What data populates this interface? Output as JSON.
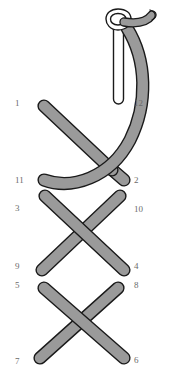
{
  "figure": {
    "background_color": "#ffffff",
    "strand_fill": "#9a9a9a",
    "strand_stroke": "#1a1a1a",
    "needle_fill": "#ffffff",
    "needle_stroke": "#1a1a1a",
    "label_color": "#6b6b6b",
    "stroke_width": 1.4,
    "strand_width": 11
  },
  "labels": [
    {
      "id": "1",
      "text": "1",
      "side": "left",
      "x": 15,
      "y": 99
    },
    {
      "id": "2",
      "text": "2",
      "side": "right",
      "x": 134,
      "y": 176
    },
    {
      "id": "3",
      "text": "3",
      "side": "left",
      "x": 15,
      "y": 204
    },
    {
      "id": "4",
      "text": "4",
      "side": "right",
      "x": 134,
      "y": 262
    },
    {
      "id": "5",
      "text": "5",
      "side": "left",
      "x": 15,
      "y": 281
    },
    {
      "id": "6",
      "text": "6",
      "side": "right",
      "x": 134,
      "y": 356
    },
    {
      "id": "7",
      "text": "7",
      "side": "left",
      "x": 15,
      "y": 357
    },
    {
      "id": "8",
      "text": "8",
      "side": "right",
      "x": 134,
      "y": 281
    },
    {
      "id": "9",
      "text": "9",
      "side": "left",
      "x": 15,
      "y": 262
    },
    {
      "id": "10",
      "text": "10",
      "side": "right",
      "x": 134,
      "y": 205
    },
    {
      "id": "11",
      "text": "11",
      "side": "left",
      "x": 15,
      "y": 176
    },
    {
      "id": "12",
      "text": "12",
      "side": "right",
      "x": 134,
      "y": 99
    }
  ],
  "strands": [
    {
      "id": "strand-1-2",
      "from": "1",
      "to": "2",
      "direction": "down-right",
      "over": true
    },
    {
      "id": "strand-11-arc",
      "from": "11",
      "to": "needle",
      "direction": "curve-right-up",
      "over": false
    },
    {
      "id": "strand-3-4",
      "from": "3",
      "to": "4",
      "direction": "down-right",
      "over": true
    },
    {
      "id": "strand-10-9",
      "from": "10",
      "to": "9",
      "direction": "down-left",
      "over": false
    },
    {
      "id": "strand-5-6",
      "from": "5",
      "to": "6",
      "direction": "down-right",
      "over": true
    },
    {
      "id": "strand-8-7",
      "from": "8",
      "to": "7",
      "direction": "down-left",
      "over": false
    }
  ],
  "needle": {
    "id": "needle",
    "type": "eyed-needle-with-shank",
    "eye_position": {
      "x": 122,
      "y": 21
    },
    "shank_top": {
      "x": 118,
      "y": 22
    },
    "shank_bottom": {
      "x": 120,
      "y": 101
    }
  }
}
